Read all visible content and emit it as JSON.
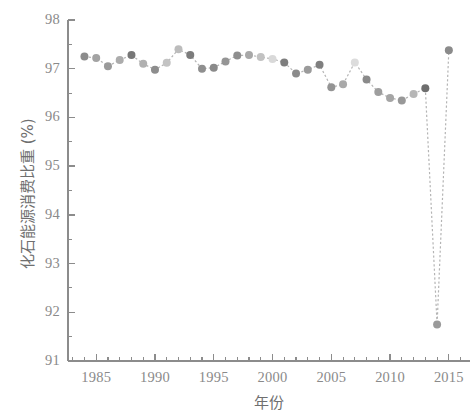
{
  "chart_data": {
    "type": "scatter",
    "title": "",
    "xlabel": "年份",
    "ylabel": "化石能源消费比重 (%)",
    "xlim": [
      1982.6,
      2016.8
    ],
    "ylim": [
      91,
      98
    ],
    "grid": false,
    "legend": null,
    "yticks": [
      91,
      92,
      93,
      94,
      95,
      96,
      97,
      98
    ],
    "ytick_labels": [
      "91",
      "92",
      "93",
      "94",
      "95",
      "96",
      "97",
      "98"
    ],
    "yminor_step": 0.5,
    "xticks": [
      1985,
      1990,
      1995,
      2000,
      2005,
      2010,
      2015
    ],
    "xtick_labels": [
      "1985",
      "1990",
      "1995",
      "2000",
      "2005",
      "2010",
      "2015"
    ],
    "xminor_step": 1,
    "marker": "circle",
    "marker_size": 8,
    "line_style": "dotted",
    "line_color": "#b4b4b4",
    "axis_color": "#8c8c8c",
    "tick_label_color": "#8a8a8a",
    "axis_label_color": "#6f6f6f",
    "x": [
      1984,
      1985,
      1986,
      1987,
      1988,
      1989,
      1990,
      1991,
      1992,
      1993,
      1994,
      1995,
      1996,
      1997,
      1998,
      1999,
      2000,
      2001,
      2002,
      2003,
      2004,
      2005,
      2006,
      2007,
      2008,
      2009,
      2010,
      2011,
      2012,
      2013,
      2014,
      2015
    ],
    "values": [
      97.25,
      97.22,
      97.05,
      97.18,
      97.28,
      97.1,
      96.98,
      97.12,
      97.4,
      97.28,
      97.0,
      97.02,
      97.15,
      97.27,
      97.28,
      97.24,
      97.2,
      97.13,
      96.9,
      96.98,
      97.08,
      96.62,
      96.68,
      97.13,
      96.78,
      96.52,
      96.4,
      96.35,
      96.48,
      96.6,
      91.75,
      97.38
    ],
    "marker_colors": [
      "#8c8c8c",
      "#a3a3a3",
      "#9a9a9a",
      "#acacac",
      "#777777",
      "#b0b0b0",
      "#8d8d8d",
      "#c3c3c3",
      "#bcbcbc",
      "#7c7c7c",
      "#8f8f8f",
      "#8a8a8a",
      "#959595",
      "#8e8e8e",
      "#a8a8a8",
      "#c2c2c2",
      "#d9d9d9",
      "#7e7e7e",
      "#8b8b8b",
      "#9b9b9b",
      "#7f7f7f",
      "#949494",
      "#a9a9a9",
      "#dcdcdc",
      "#8a8a8a",
      "#9e9e9e",
      "#a5a5a5",
      "#989898",
      "#b6b6b6",
      "#6e6e6e",
      "#9a9a9a",
      "#8b8b8b"
    ]
  }
}
